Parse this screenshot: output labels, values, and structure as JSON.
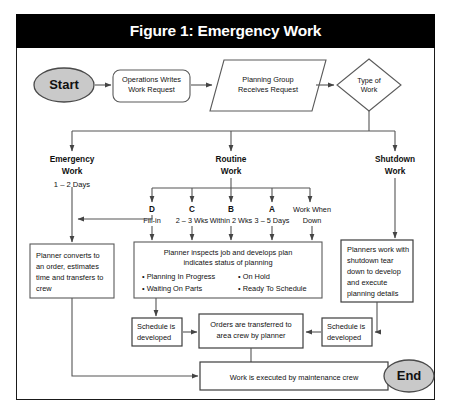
{
  "figure": {
    "title": "Figure 1: Emergency Work",
    "title_bg": "#000000",
    "title_color": "#ffffff",
    "frame_border": "#1a1a1a"
  },
  "nodes": {
    "start": {
      "label": "Start",
      "shape": "terminator",
      "fill": "#c9c9c9"
    },
    "end": {
      "label": "End",
      "shape": "terminator",
      "fill": "#c9c9c9"
    },
    "ops_request": {
      "line1": "Operations Writes",
      "line2": "Work Request",
      "shape": "rounded-rect"
    },
    "planning_group": {
      "line1": "Planning Group",
      "line2": "Receives Request",
      "shape": "parallelogram"
    },
    "type_of_work": {
      "line1": "Type of",
      "line2": "Work",
      "shape": "diamond"
    },
    "planner_converts": {
      "shape": "rect",
      "lines": [
        "Planner converts to",
        "an order, estimates",
        "time and transfers to",
        "crew"
      ]
    },
    "planner_inspects": {
      "shape": "rect",
      "heading": [
        "Planner inspects job and develops plan",
        "indicates status of planning"
      ],
      "bullets_left": [
        "• Planning In Progress",
        "• Waiting On Parts"
      ],
      "bullets_right": [
        "• On Hold",
        "• Ready To Schedule"
      ]
    },
    "planners_shutdown": {
      "shape": "rect",
      "lines": [
        "Planners work with",
        "shutdown tear",
        "down to develop",
        "and execute",
        "planning details"
      ]
    },
    "schedule_left": {
      "shape": "rect",
      "lines": [
        "Schedule is",
        "developed"
      ]
    },
    "schedule_right": {
      "shape": "rect",
      "lines": [
        "Schedule is",
        "developed"
      ]
    },
    "orders_transferred": {
      "shape": "rect",
      "lines": [
        "Orders are transferred to",
        "area crew by planner"
      ]
    },
    "work_executed": {
      "shape": "rect",
      "lines": [
        "Work is executed by maintenance crew"
      ]
    }
  },
  "branches": [
    {
      "id": "emergency",
      "title1": "Emergency",
      "title2": "Work",
      "subtitle": "1 – 2 Days"
    },
    {
      "id": "routine",
      "title1": "Routine",
      "title2": "Work",
      "subtitle": ""
    },
    {
      "id": "shutdown",
      "title1": "Shutdown",
      "title2": "Work",
      "subtitle": ""
    }
  ],
  "priorities": [
    {
      "code": "D",
      "timing": "Fill-in"
    },
    {
      "code": "C",
      "timing": "2 – 3 Wks"
    },
    {
      "code": "B",
      "timing": "Within 2 Wks"
    },
    {
      "code": "A",
      "timing": "3 – 5 Days"
    },
    {
      "code": "Work When",
      "timing": "Down"
    }
  ]
}
